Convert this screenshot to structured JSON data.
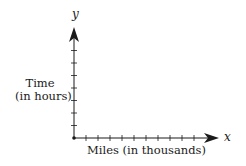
{
  "chart_data": {
    "type": "line",
    "title": "",
    "xlabel": "Miles  (in thousands)",
    "ylabel": "Time (in hours)",
    "x_axis_symbol": "x",
    "y_axis_symbol": "y",
    "x_ticks": 10,
    "y_ticks": 7,
    "tick_labels": false,
    "grid": false,
    "legend": null,
    "series": [],
    "axis_color": "#1a1a1a"
  },
  "labels": {
    "y_symbol": "y",
    "x_symbol": "x",
    "ylabel_line1": "Time",
    "ylabel_line2": "(in hours)",
    "xlabel": "Miles  (in thousands)"
  }
}
